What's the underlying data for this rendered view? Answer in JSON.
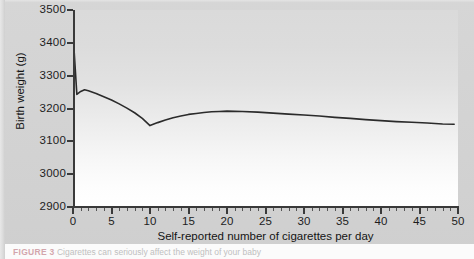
{
  "figure": {
    "caption_label": "FIGURE 3",
    "caption_text": "Cigarettes can seriously affect the weight of your baby"
  },
  "colors": {
    "line": "#2b2b2b",
    "axis": "#3a3a3a",
    "text": "#1d1d1d",
    "plot_top": "#dadada",
    "plot_bottom": "#ffffff",
    "page_background": "#d2d2d2"
  },
  "chart_data": {
    "type": "line",
    "title": "",
    "subtitle": "",
    "xlabel": "Self-reported number of cigarettes per day",
    "ylabel": "Birth weight (g)",
    "xlim": [
      0,
      50
    ],
    "ylim": [
      2900,
      3500
    ],
    "grid": false,
    "legend": null,
    "x_ticks": [
      0,
      5,
      10,
      15,
      20,
      25,
      30,
      35,
      40,
      45,
      50
    ],
    "x_tick_labels": [
      "0",
      "5",
      "10",
      "15",
      "20",
      "25",
      "30",
      "35",
      "40",
      "45",
      "50"
    ],
    "x_minor_tick_step": 1,
    "y_ticks": [
      2900,
      3000,
      3100,
      3200,
      3300,
      3400,
      3500
    ],
    "y_tick_labels": [
      "2900",
      "3000",
      "3100",
      "3200",
      "3300",
      "3400",
      "3500"
    ],
    "series": [
      {
        "name": "Mean birth weight",
        "x": [
          0,
          0.5,
          1.0,
          1.5,
          2,
          3,
          4,
          5,
          6,
          7,
          8,
          9,
          10,
          11,
          12,
          13,
          14,
          15,
          16,
          17,
          18,
          19,
          20,
          22,
          24,
          26,
          28,
          30,
          32,
          34,
          36,
          38,
          40,
          42,
          44,
          46,
          48,
          49.5
        ],
        "values": [
          3430,
          3243,
          3252,
          3257,
          3254,
          3246,
          3236,
          3226,
          3214,
          3201,
          3187,
          3170,
          3148,
          3157,
          3165,
          3172,
          3177,
          3182,
          3185,
          3188,
          3190,
          3191,
          3192,
          3191,
          3189,
          3186,
          3183,
          3180,
          3177,
          3173,
          3170,
          3166,
          3163,
          3160,
          3158,
          3156,
          3153,
          3152
        ]
      }
    ]
  }
}
